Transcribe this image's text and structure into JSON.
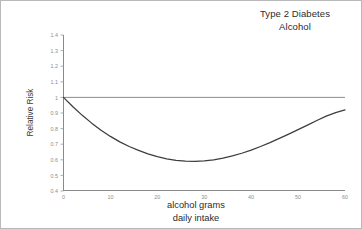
{
  "figure": {
    "background_color": "#ffffff",
    "border_color": "#b9b9b9"
  },
  "chart_data": {
    "type": "line",
    "title": "Type 2 Diabetes\nAlcohol",
    "title_lines": [
      "Type 2 Diabetes",
      "Alcohol"
    ],
    "xlabel": "alcohol grams daily intake",
    "xlabel_lines": [
      "alcohol grams",
      "daily intake"
    ],
    "ylabel": "Relative Risk",
    "xlim": [
      0,
      60
    ],
    "ylim": [
      0.4,
      1.4
    ],
    "xticks": [
      0,
      10,
      20,
      30,
      40,
      50,
      60
    ],
    "xtick_labels": [
      "0",
      "10",
      "20",
      "30",
      "40",
      "50",
      "60"
    ],
    "yticks": [
      0.4,
      0.5,
      0.6,
      0.7,
      0.8,
      0.9,
      1,
      1.1,
      1.2,
      1.3,
      1.4
    ],
    "ytick_labels": [
      "0.4",
      "0.5",
      "0.6",
      "0.7",
      "0.8",
      "0.9",
      "1",
      "1.1",
      "1.2",
      "1.3",
      "1.4"
    ],
    "grid": false,
    "legend": null,
    "reference_line": {
      "name": "no-effect-line",
      "y": 1.0,
      "color": "#808080",
      "orientation": "horizontal"
    },
    "series": [
      {
        "name": "Relative Risk",
        "color": "#3d3d3d",
        "x": [
          0,
          2,
          4,
          6,
          8,
          10,
          12,
          14,
          16,
          18,
          20,
          22,
          24,
          26,
          28,
          30,
          32,
          34,
          36,
          38,
          40,
          42,
          44,
          46,
          48,
          50,
          52,
          54,
          56,
          58,
          60
        ],
        "values": [
          1.0,
          0.94,
          0.885,
          0.835,
          0.79,
          0.75,
          0.715,
          0.685,
          0.66,
          0.638,
          0.62,
          0.606,
          0.596,
          0.591,
          0.59,
          0.593,
          0.6,
          0.611,
          0.625,
          0.642,
          0.662,
          0.685,
          0.71,
          0.737,
          0.765,
          0.793,
          0.822,
          0.852,
          0.88,
          0.902,
          0.92
        ]
      }
    ],
    "annotations": [
      {
        "name": "minimum-point",
        "x": 27,
        "y": 0.59,
        "label": ""
      }
    ]
  }
}
